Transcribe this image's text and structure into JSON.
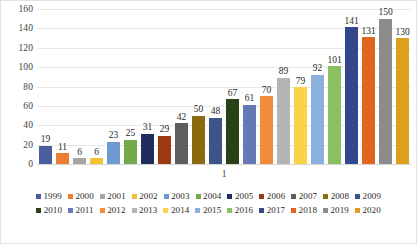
{
  "chart_data": {
    "type": "bar",
    "title": "",
    "subtitle": "",
    "xlabel": "1",
    "ylabel": "",
    "ylim": [
      0,
      160
    ],
    "ytick_step": 20,
    "yticks": [
      160,
      140,
      120,
      100,
      80,
      60,
      40,
      20,
      0
    ],
    "grid": true,
    "legend_position": "bottom",
    "categories": [
      "1999",
      "2000",
      "2001",
      "2002",
      "2003",
      "2004",
      "2005",
      "2006",
      "2007",
      "2008",
      "2009",
      "2010",
      "2011",
      "2012",
      "2013",
      "2014",
      "2015",
      "2016",
      "2017",
      "2018",
      "2019",
      "2020"
    ],
    "values": [
      19,
      11,
      6,
      6,
      23,
      25,
      31,
      29,
      42,
      50,
      48,
      67,
      61,
      70,
      89,
      79,
      92,
      101,
      141,
      131,
      150,
      130
    ],
    "series": [
      {
        "name": "",
        "values": [
          19,
          11,
          6,
          6,
          23,
          25,
          31,
          29,
          42,
          50,
          48,
          67,
          61,
          70,
          89,
          79,
          92,
          101,
          141,
          131,
          150,
          130
        ]
      }
    ],
    "colors": [
      "#4a5e9e",
      "#ed7d31",
      "#a5a5a5",
      "#f2c233",
      "#6e9bd1",
      "#73ab4b",
      "#1f2d5c",
      "#9e3a12",
      "#5e5e5e",
      "#8a6a0c",
      "#3c5488",
      "#2a4016",
      "#6679b5",
      "#f08c3c",
      "#b4b4b4",
      "#fbd346",
      "#8cb0dd",
      "#8bc061",
      "#34478c",
      "#e1641f",
      "#8c8c8c",
      "#dca01c"
    ],
    "data_labels": [
      "19",
      "11",
      "6",
      "6",
      "23",
      "25",
      "31",
      "29",
      "42",
      "50",
      "48",
      "67",
      "61",
      "70",
      "89",
      "79",
      "92",
      "101",
      "141",
      "131",
      "150",
      "130"
    ],
    "legend_rows": [
      [
        "1999",
        "2000",
        "2001",
        "2002",
        "2003",
        "2004",
        "2005",
        "2006",
        "2007",
        "2008",
        "2009"
      ],
      [
        "2010",
        "2011",
        "2012",
        "2013",
        "2014",
        "2015",
        "2016",
        "2017",
        "2018",
        "2019",
        "2020"
      ]
    ]
  },
  "style": {
    "background": "#ffffff",
    "border_color": "#e2e2e2",
    "gridline_color": "#e8e8e8",
    "text_color": "#2a2a2a"
  }
}
